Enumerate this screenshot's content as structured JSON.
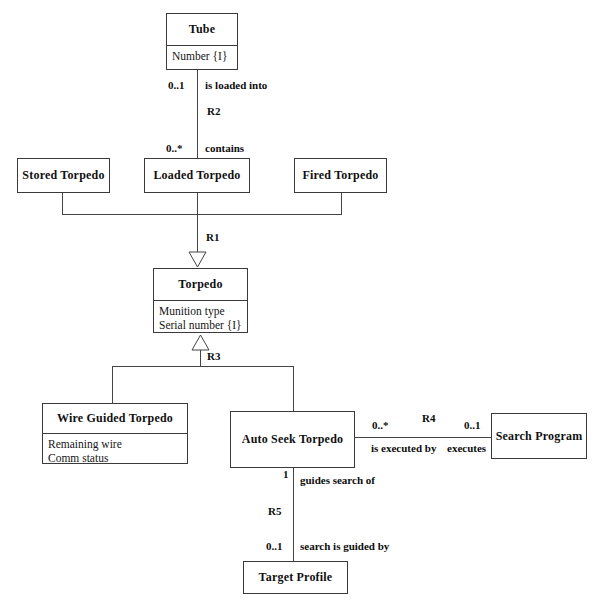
{
  "diagram": {
    "classes": [
      {
        "id": "tube",
        "name": "Tube",
        "attributes": [
          "Number {I}"
        ]
      },
      {
        "id": "stored_torpedo",
        "name": "Stored Torpedo",
        "attributes": []
      },
      {
        "id": "loaded_torpedo",
        "name": "Loaded Torpedo",
        "attributes": []
      },
      {
        "id": "fired_torpedo",
        "name": "Fired Torpedo",
        "attributes": []
      },
      {
        "id": "torpedo",
        "name": "Torpedo",
        "attributes": [
          "Munition type",
          "Serial number {I}"
        ]
      },
      {
        "id": "wire_guided_torpedo",
        "name": "Wire Guided Torpedo",
        "attributes": [
          "Remaining wire",
          "Comm status"
        ]
      },
      {
        "id": "auto_seek_torpedo",
        "name": "Auto Seek Torpedo",
        "attributes": []
      },
      {
        "id": "search_program",
        "name": "Search Program",
        "attributes": []
      },
      {
        "id": "target_profile",
        "name": "Target Profile",
        "attributes": []
      }
    ],
    "relationships": [
      {
        "id": "R2",
        "label": "R2",
        "type": "association",
        "from": "tube",
        "to": "loaded_torpedo",
        "from_multiplicity": "0..1",
        "from_role": "is loaded into",
        "to_multiplicity": "0..*",
        "to_role": "contains"
      },
      {
        "id": "R1",
        "label": "R1",
        "type": "generalization",
        "superclass": "torpedo",
        "subclasses": [
          "stored_torpedo",
          "loaded_torpedo",
          "fired_torpedo"
        ]
      },
      {
        "id": "R3",
        "label": "R3",
        "type": "generalization",
        "superclass": "torpedo",
        "subclasses": [
          "wire_guided_torpedo",
          "auto_seek_torpedo"
        ]
      },
      {
        "id": "R4",
        "label": "R4",
        "type": "association",
        "from": "auto_seek_torpedo",
        "to": "search_program",
        "from_multiplicity": "0..*",
        "from_role": "is executed by",
        "to_multiplicity": "0..1",
        "to_role": "executes"
      },
      {
        "id": "R5",
        "label": "R5",
        "type": "association",
        "from": "auto_seek_torpedo",
        "to": "target_profile",
        "from_multiplicity": "1",
        "from_role": "guides search of",
        "to_multiplicity": "0..1",
        "to_role": "search is guided by"
      }
    ],
    "colors": {
      "line": "#444444",
      "border": "#3a3a3a",
      "text": "#101010",
      "background": "#ffffff"
    }
  }
}
